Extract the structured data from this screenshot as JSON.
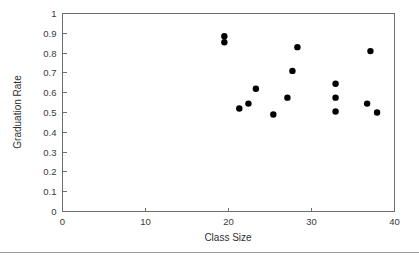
{
  "chart_data": {
    "type": "scatter",
    "title": "",
    "xlabel": "Class Size",
    "ylabel": "Graduation Rate",
    "xlim": [
      0,
      40
    ],
    "ylim": [
      0,
      1
    ],
    "grid": false,
    "legend": null,
    "xticks": [
      "0",
      "10",
      "20",
      "30",
      "40"
    ],
    "xtick_values": [
      0,
      10,
      20,
      30,
      40
    ],
    "yticks": [
      "0",
      "0.1",
      "0.2",
      "0.3",
      "0.4",
      "0.5",
      "0.6",
      "0.7",
      "0.8",
      "0.9",
      "1"
    ],
    "ytick_values": [
      0,
      0.1,
      0.2,
      0.3,
      0.4,
      0.5,
      0.6,
      0.7,
      0.8,
      0.9,
      1
    ],
    "marker": {
      "shape": "circle",
      "color": "#000000",
      "radius_px": 3.2
    },
    "points": [
      {
        "x": 19.5,
        "y": 0.885
      },
      {
        "x": 19.5,
        "y": 0.855
      },
      {
        "x": 21.3,
        "y": 0.52
      },
      {
        "x": 22.4,
        "y": 0.545
      },
      {
        "x": 23.3,
        "y": 0.62
      },
      {
        "x": 25.4,
        "y": 0.49
      },
      {
        "x": 27.1,
        "y": 0.575
      },
      {
        "x": 27.7,
        "y": 0.71
      },
      {
        "x": 28.3,
        "y": 0.83
      },
      {
        "x": 32.9,
        "y": 0.645
      },
      {
        "x": 32.9,
        "y": 0.575
      },
      {
        "x": 32.9,
        "y": 0.505
      },
      {
        "x": 36.7,
        "y": 0.545
      },
      {
        "x": 37.1,
        "y": 0.81
      },
      {
        "x": 37.9,
        "y": 0.5
      }
    ],
    "colors": {
      "axis": "#6e6e6e",
      "marker": "#000000",
      "tick_text": "#3a3a3a",
      "title_text": "#2e2e2e",
      "background": "#ffffff",
      "footer_rule": "#9a9a9a"
    }
  }
}
